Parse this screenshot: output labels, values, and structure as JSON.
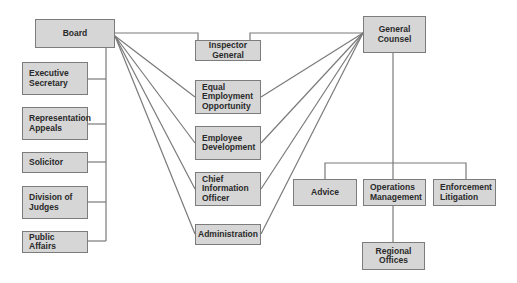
{
  "diagram": {
    "type": "organizational-chart",
    "nodes": {
      "board": "Board",
      "executive_secretary": "Executive\nSecretary",
      "representation_appeals": "Representation\nAppeals",
      "solicitor": "Solicitor",
      "division_of_judges": "Division of\nJudges",
      "public_affairs": "Public Affairs",
      "inspector_general": "Inspector\nGeneral",
      "equal_employment_opportunity": "Equal\nEmployment\nOpportunity",
      "employee_development": "Employee\nDevelopment",
      "chief_information_officer": "Chief\nInformation\nOfficer",
      "administration": "Administration",
      "general_counsel": "General\nCounsel",
      "advice": "Advice",
      "operations_management": "Operations\nManagement",
      "enforcement_litigation": "Enforcement\nLitigation",
      "regional_offices": "Regional Offices"
    },
    "edges": [
      [
        "Board",
        "Executive Secretary"
      ],
      [
        "Board",
        "Representation Appeals"
      ],
      [
        "Board",
        "Solicitor"
      ],
      [
        "Board",
        "Division of Judges"
      ],
      [
        "Board",
        "Public Affairs"
      ],
      [
        "Board",
        "Inspector General"
      ],
      [
        "Board",
        "Equal Employment Opportunity"
      ],
      [
        "Board",
        "Employee Development"
      ],
      [
        "Board",
        "Chief Information Officer"
      ],
      [
        "Board",
        "Administration"
      ],
      [
        "General Counsel",
        "Inspector General"
      ],
      [
        "General Counsel",
        "Equal Employment Opportunity"
      ],
      [
        "General Counsel",
        "Employee Development"
      ],
      [
        "General Counsel",
        "Chief Information Officer"
      ],
      [
        "General Counsel",
        "Administration"
      ],
      [
        "General Counsel",
        "Advice"
      ],
      [
        "General Counsel",
        "Operations Management"
      ],
      [
        "General Counsel",
        "Enforcement Litigation"
      ],
      [
        "Operations Management",
        "Regional Offices"
      ]
    ],
    "colors": {
      "box_fill": "#d6d6d6",
      "box_border": "#7c7c7c",
      "line": "#7a7a7a",
      "text": "#2a2a2a"
    }
  }
}
